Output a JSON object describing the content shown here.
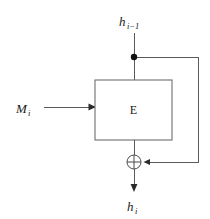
{
  "diagram": {
    "type": "block-diagram",
    "colors": {
      "background": "#ffffff",
      "wire": "#5a5a5a",
      "wire_dark": "#3a3a3a",
      "box_stroke": "#6e6e6e",
      "box_fill": "#ffffff",
      "text": "#1a1a1a",
      "junction_dot": "#111111",
      "arrowhead": "#2b2b2b"
    },
    "labels": {
      "chaining_input": {
        "base": "h",
        "subscript": "i−1",
        "full": "h(i−1)",
        "role": "previous chaining value input"
      },
      "message_input": {
        "base": "M",
        "subscript": "i",
        "full": "M(i)",
        "role": "message block input"
      },
      "cipher_block": {
        "text": "E",
        "role": "block cipher encryption function"
      },
      "chaining_output": {
        "base": "h",
        "subscript": "i",
        "full": "h(i)",
        "role": "new chaining value output"
      },
      "xor_operator": {
        "symbol": "⊕",
        "role": "exclusive-or combination"
      }
    },
    "nodes": [
      {
        "id": "h-prev-label",
        "name": "chaining-input-label",
        "x": 122,
        "y": 20
      },
      {
        "id": "m-label",
        "name": "message-input-label",
        "x": 18,
        "y": 107
      },
      {
        "id": "cipher-box",
        "name": "cipher-block",
        "x": 95,
        "y": 80,
        "width": 77,
        "height": 60
      },
      {
        "id": "junction",
        "name": "feedback-junction",
        "x": 134,
        "y": 57,
        "radius": 3.2
      },
      {
        "id": "xor",
        "name": "xor-node",
        "x": 134,
        "y": 162,
        "radius": 7
      },
      {
        "id": "h-out-label",
        "name": "chaining-output-label",
        "x": 127,
        "y": 207
      }
    ],
    "edges": [
      {
        "name": "chaining-input-wire",
        "from": "h-prev-label",
        "to": "cipher-box",
        "direction": "down"
      },
      {
        "name": "message-input-wire",
        "from": "m-label",
        "to": "cipher-box",
        "direction": "right",
        "arrow": true
      },
      {
        "name": "cipher-output-wire",
        "from": "cipher-box",
        "to": "xor",
        "direction": "down"
      },
      {
        "name": "feedback-wire",
        "from": "junction",
        "to": "xor",
        "direction": "right-down-left",
        "arrow": true
      },
      {
        "name": "chaining-output-wire",
        "from": "xor",
        "to": "h-out-label",
        "direction": "down",
        "arrow": true
      }
    ]
  }
}
